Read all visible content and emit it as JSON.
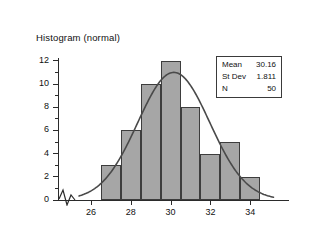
{
  "chart_data": {
    "type": "bar",
    "title": "Histogram (normal)",
    "xlabel": "",
    "ylabel": "",
    "categories": [
      "26.5-27.5",
      "27.5-28.5",
      "28.5-29.5",
      "29.5-30.5",
      "30.5-31.5",
      "31.5-32.5",
      "32.5-33.5",
      "33.5-34.5"
    ],
    "bin_edges": [
      26.5,
      27.5,
      28.5,
      29.5,
      30.5,
      31.5,
      32.5,
      33.5,
      34.5
    ],
    "bin_centers": [
      27,
      28,
      29,
      30,
      31,
      32,
      33,
      34
    ],
    "values": [
      3,
      6,
      10,
      12,
      8,
      4,
      5,
      2
    ],
    "xlim": [
      25.4,
      35.2
    ],
    "ylim": [
      0,
      12.6
    ],
    "xticks": [
      26,
      28,
      30,
      32,
      34
    ],
    "xtick_labels": [
      "26",
      "28",
      "30",
      "32",
      "34"
    ],
    "yticks": [
      0,
      2,
      4,
      6,
      8,
      10,
      12
    ],
    "ytick_labels": [
      "0",
      "2",
      "4",
      "6",
      "8",
      "10",
      "12"
    ],
    "yticks_minor": [
      1,
      3,
      5,
      7,
      9,
      11
    ],
    "grid": false,
    "axis_break": true,
    "overlay": {
      "type": "line",
      "name": "normal-fit-curve",
      "mean": 30.16,
      "stdev": 1.811,
      "n": 50,
      "peak_value": 11.0
    },
    "legend_position": "top-right",
    "colors": {
      "bar_fill": "#a6a6a6",
      "bar_edge": "#3d3d3d",
      "curve": "#4a4a4a",
      "axis": "#2b2b2b",
      "background": "#ffffff",
      "text": "#111111"
    }
  },
  "stats_box": {
    "rows": [
      {
        "key": "Mean",
        "value": "30.16"
      },
      {
        "key": "St Dev",
        "value": "1.811"
      },
      {
        "key": "N",
        "value": "50"
      }
    ]
  }
}
